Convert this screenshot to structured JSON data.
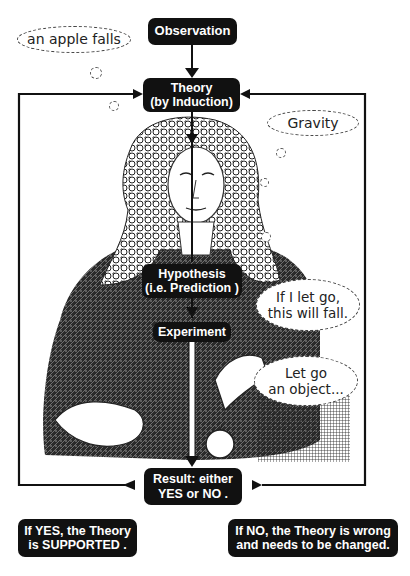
{
  "diagram": {
    "nodes": {
      "observation": {
        "label": "Observation"
      },
      "theory": {
        "line1": "Theory",
        "line2": "(by Induction)"
      },
      "hypothesis": {
        "line1": "Hypothesis",
        "line2": "(i.e. Prediction )"
      },
      "experiment": {
        "label": "Experiment"
      },
      "result": {
        "line1": "Result: either",
        "line2": "YES or NO ."
      },
      "yes_outcome": {
        "line1": "If YES, the Theory",
        "line2": "is SUPPORTED ."
      },
      "no_outcome": {
        "line1": "If NO, the Theory is wrong",
        "line2": "and needs to be changed."
      }
    },
    "thought_bubbles": {
      "observation_example": "an apple falls",
      "theory_example": "Gravity",
      "prediction_example": {
        "line1": "If I let go,",
        "line2": "this will fall."
      },
      "experiment_example": {
        "line1": "Let go",
        "line2": "an object..."
      }
    },
    "edges": [
      {
        "from": "Observation",
        "to": "Theory"
      },
      {
        "from": "Theory",
        "to": "Hypothesis"
      },
      {
        "from": "Hypothesis",
        "to": "Experiment"
      },
      {
        "from": "Experiment",
        "to": "Result"
      },
      {
        "from": "Result",
        "to": "Theory",
        "side": "left",
        "meaning": "YES"
      },
      {
        "from": "Result",
        "to": "Theory",
        "side": "right",
        "meaning": "NO"
      }
    ],
    "colors": {
      "box_fill": "#111111",
      "box_text": "#ffffff",
      "line": "#111111",
      "bubble_border": "#444444"
    }
  }
}
